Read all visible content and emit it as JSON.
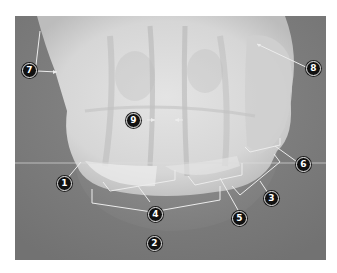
{
  "figure": {
    "type": "radiograph",
    "colors": {
      "background_tissue": "#7a7a7a",
      "bone": "#e0e0e0",
      "leader_line": "#e6e6e6",
      "callout_fill": "#111111",
      "callout_text": "#ffffff"
    }
  },
  "callouts": [
    {
      "id": "1",
      "label": "1"
    },
    {
      "id": "2",
      "label": "2"
    },
    {
      "id": "3",
      "label": "3"
    },
    {
      "id": "4",
      "label": "4"
    },
    {
      "id": "5",
      "label": "5"
    },
    {
      "id": "6",
      "label": "6"
    },
    {
      "id": "7",
      "label": "7"
    },
    {
      "id": "8",
      "label": "8"
    },
    {
      "id": "9",
      "label": "9"
    }
  ]
}
